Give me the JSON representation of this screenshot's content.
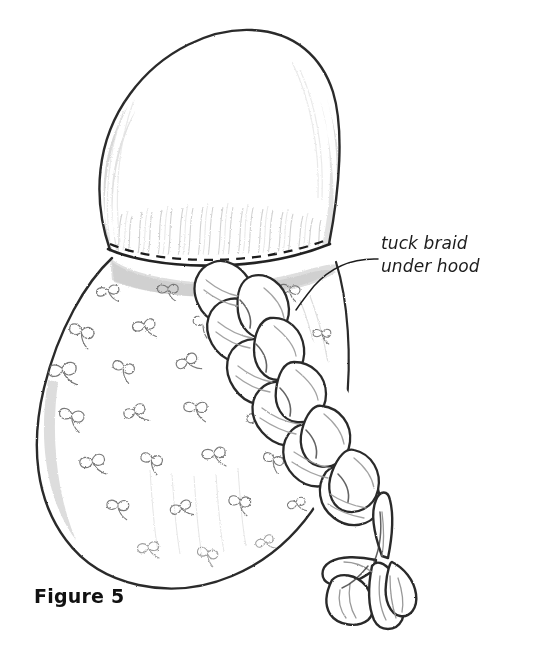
{
  "figure": {
    "caption": "Figure 5",
    "medium": "pencil sketch"
  },
  "annotations": [
    {
      "name": "tuck-braid-annotation",
      "line1": "tuck braid",
      "line2": "under hood",
      "points_to": "hood hem where braid is tucked"
    }
  ],
  "colors": {
    "background": "#ffffff",
    "ink": "#1c1c1c",
    "outline": "#2b2b2b",
    "shading": "#9a9a9a",
    "light_shading": "#c4c4c4",
    "pattern": "#6e6e6e"
  },
  "parts": {
    "hood": "domed hood with pencil shading",
    "hem_stitching": "dashed stitch line along hood hem",
    "cloak": "teardrop shaped cloak body with scattered floral sprig print",
    "braid": "three-strand braid emerging from under hood",
    "tassel": "loose fanned strands at braid end"
  }
}
